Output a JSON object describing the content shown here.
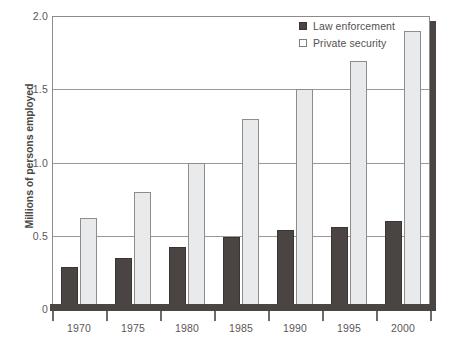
{
  "chart_data": {
    "type": "bar",
    "title": "",
    "xlabel": "",
    "ylabel": "Millions of persons employed",
    "categories": [
      "1970",
      "1975",
      "1980",
      "1985",
      "1990",
      "1995",
      "2000"
    ],
    "series": [
      {
        "name": "Law enforcement",
        "color": "#4a4542",
        "values": [
          0.29,
          0.35,
          0.42,
          0.49,
          0.54,
          0.56,
          0.6
        ]
      },
      {
        "name": "Private security",
        "color": "#e8eaeb",
        "values": [
          0.62,
          0.8,
          1.0,
          1.3,
          1.5,
          1.69,
          1.9
        ]
      }
    ],
    "ylim": [
      0,
      2.0
    ],
    "yticks": [
      0,
      0.5,
      1.0,
      1.5,
      2.0
    ],
    "ytick_labels": [
      "0",
      "0.5",
      "1.0",
      "1.5",
      "2.0"
    ],
    "grid": true,
    "legend_position": "top-right"
  },
  "colors": {
    "law_enforcement": "#4a4542",
    "private_security": "#e8eaeb",
    "gridline": "#9a9896",
    "frame": "#8d8a88",
    "text": "#55514f"
  }
}
